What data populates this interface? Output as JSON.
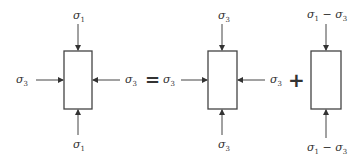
{
  "diagram": {
    "operators": {
      "equals": "=",
      "plus": "+"
    },
    "elements": [
      {
        "name": "total-stress",
        "top": {
          "sym": "σ",
          "sub": "1"
        },
        "bottom": {
          "sym": "σ",
          "sub": "1"
        },
        "left": {
          "sym": "σ",
          "sub": "3"
        },
        "right": {
          "sym": "σ",
          "sub": "3"
        }
      },
      {
        "name": "hydrostatic-stress",
        "top": {
          "sym": "σ",
          "sub": "3"
        },
        "bottom": {
          "sym": "σ",
          "sub": "3"
        },
        "left": {
          "sym": "σ",
          "sub": "3"
        },
        "right": {
          "sym": "σ",
          "sub": "3"
        }
      },
      {
        "name": "deviatoric-stress",
        "top": {
          "sym": "σ",
          "sub": "1",
          "minus": " − ",
          "sym2": "σ",
          "sub2": "3"
        },
        "bottom": {
          "sym": "σ",
          "sub": "1",
          "minus": " − ",
          "sym2": "σ",
          "sub2": "3"
        }
      }
    ],
    "colors": {
      "stroke": "#444444",
      "text": "#333333",
      "background": "#ffffff"
    }
  }
}
